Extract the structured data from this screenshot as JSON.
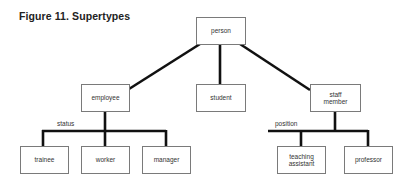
{
  "figure": {
    "title": "Figure 11. Supertypes"
  },
  "nodes": {
    "person": "person",
    "employee": "employee",
    "student": "student",
    "staff_member": "staff member",
    "trainee": "trainee",
    "worker": "worker",
    "manager": "manager",
    "teaching_assistant": "teaching assistant",
    "professor": "professor"
  },
  "discriminators": {
    "employee": "status",
    "staff_member": "position"
  },
  "colors": {
    "line": "#111111",
    "box_border": "#7a7a7a"
  }
}
